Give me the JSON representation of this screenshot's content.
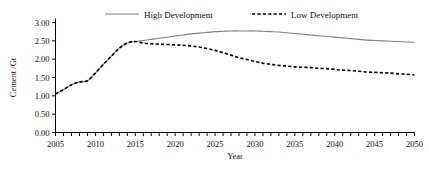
{
  "chart_data": {
    "type": "line",
    "title": "",
    "xlabel": "Year",
    "ylabel": "Cement /Gt",
    "xlim": [
      2005,
      2050
    ],
    "ylim": [
      0.0,
      3.0
    ],
    "ytick_step": 0.5,
    "xtick_step": 5,
    "xtick_minor_step": 1,
    "grid": false,
    "legend_position": "top-inside",
    "x": [
      2005,
      2006,
      2007,
      2008,
      2009,
      2010,
      2011,
      2012,
      2013,
      2014,
      2015,
      2016,
      2017,
      2018,
      2019,
      2020,
      2021,
      2022,
      2023,
      2024,
      2025,
      2026,
      2027,
      2028,
      2029,
      2030,
      2031,
      2032,
      2033,
      2034,
      2035,
      2036,
      2037,
      2038,
      2039,
      2040,
      2041,
      2042,
      2043,
      2044,
      2045,
      2046,
      2047,
      2048,
      2049,
      2050
    ],
    "series": [
      {
        "name": "High Development",
        "style": "solid",
        "color": "#808080",
        "values": [
          1.05,
          1.17,
          1.3,
          1.38,
          1.41,
          1.62,
          1.86,
          2.08,
          2.3,
          2.44,
          2.48,
          2.51,
          2.54,
          2.57,
          2.6,
          2.63,
          2.66,
          2.69,
          2.71,
          2.73,
          2.75,
          2.76,
          2.77,
          2.77,
          2.77,
          2.77,
          2.76,
          2.75,
          2.74,
          2.72,
          2.7,
          2.68,
          2.66,
          2.64,
          2.62,
          2.6,
          2.58,
          2.56,
          2.54,
          2.52,
          2.51,
          2.5,
          2.49,
          2.48,
          2.47,
          2.46
        ]
      },
      {
        "name": "Low Development",
        "style": "dashed",
        "color": "#000000",
        "values": [
          1.05,
          1.17,
          1.3,
          1.38,
          1.41,
          1.62,
          1.86,
          2.08,
          2.3,
          2.44,
          2.48,
          2.44,
          2.42,
          2.41,
          2.4,
          2.39,
          2.38,
          2.36,
          2.33,
          2.29,
          2.24,
          2.18,
          2.11,
          2.04,
          1.99,
          1.94,
          1.89,
          1.86,
          1.83,
          1.81,
          1.79,
          1.78,
          1.77,
          1.75,
          1.74,
          1.72,
          1.7,
          1.69,
          1.67,
          1.65,
          1.64,
          1.63,
          1.62,
          1.6,
          1.59,
          1.57
        ]
      }
    ],
    "ytick_labels": [
      "0.00",
      "0.50",
      "1.00",
      "1.50",
      "2.00",
      "2.50",
      "3.00"
    ],
    "xtick_labels": [
      "2005",
      "2010",
      "2015",
      "2020",
      "2025",
      "2030",
      "2035",
      "2040",
      "2045",
      "2050"
    ],
    "legend": [
      {
        "label": "High Development",
        "style": "solid",
        "color": "#808080"
      },
      {
        "label": "Low Development",
        "style": "dashed",
        "color": "#000000"
      }
    ]
  }
}
